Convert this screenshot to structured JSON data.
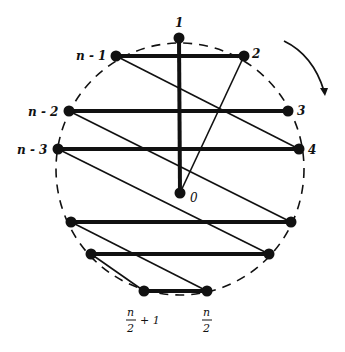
{
  "diagram": {
    "circle": {
      "cx": 180,
      "cy": 169,
      "r": 125,
      "style": "dashed"
    },
    "rotation_arrow": {
      "direction": "clockwise"
    },
    "nodes": [
      {
        "id": "1",
        "label": "1",
        "x": 179,
        "y": 38
      },
      {
        "id": "n-1",
        "label": "n - 1",
        "x": 116,
        "y": 56
      },
      {
        "id": "2",
        "label": "2",
        "x": 244,
        "y": 56
      },
      {
        "id": "n-2",
        "label": "n - 2",
        "x": 69,
        "y": 111
      },
      {
        "id": "3",
        "label": "3",
        "x": 288,
        "y": 111
      },
      {
        "id": "n-3",
        "label": "n - 3",
        "x": 58,
        "y": 149
      },
      {
        "id": "4",
        "label": "4",
        "x": 299,
        "y": 149
      },
      {
        "id": "0",
        "label": "0",
        "x": 180,
        "y": 193
      },
      {
        "id": "L1",
        "label": "",
        "x": 71,
        "y": 222
      },
      {
        "id": "R1",
        "label": "",
        "x": 291,
        "y": 222
      },
      {
        "id": "L2",
        "label": "",
        "x": 91,
        "y": 254
      },
      {
        "id": "R2",
        "label": "",
        "x": 269,
        "y": 254
      },
      {
        "id": "n/2+1",
        "label": "n/2 + 1",
        "x": 144,
        "y": 291
      },
      {
        "id": "n/2",
        "label": "n/2",
        "x": 207,
        "y": 291
      }
    ],
    "labels": {
      "one": "1",
      "two": "2",
      "three": "3",
      "four": "4",
      "zero": "0",
      "n_minus_1": "n - 1",
      "n_minus_2": "n - 2",
      "n_minus_3": "n - 3",
      "n_half_num": "n",
      "n_half_den": "2",
      "n_half_plus_num": "n",
      "n_half_plus_den": "2",
      "plus_one": "+ 1"
    },
    "thick_edges": [
      [
        "1",
        "0"
      ],
      [
        "n-1",
        "2"
      ],
      [
        "n-2",
        "3"
      ],
      [
        "n-3",
        "4"
      ],
      [
        "L1",
        "R1"
      ],
      [
        "L2",
        "R2"
      ],
      [
        "n/2+1",
        "n/2"
      ]
    ],
    "thin_edges": [
      [
        "2",
        "0"
      ],
      [
        "n-1",
        "4"
      ],
      [
        "n-2",
        "R1"
      ],
      [
        "n-3",
        "R2"
      ],
      [
        "L1",
        "n/2"
      ],
      [
        "L2",
        "n/2+1"
      ]
    ]
  }
}
